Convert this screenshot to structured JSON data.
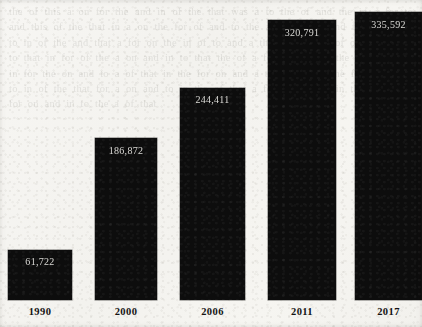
{
  "document": {
    "media": "scanned-page",
    "background_color": "#f6f5f2",
    "bleed_through_text": "the  of  this  a  on  for  the  and  in  of  the  that  was  a  to  the  of  and  the  in  a  for  to  and  this  of  the  that  in  a  on  the  for  of  and  to  the  a  in  that  of  and  the  on  for  a  to  in  of  the  and  that  a  for  on  the  in  of  to  and  a  the  that  for  in  of  on  the  a  and  to  that  in  for  of  the  a  on  and  in  to  that  the  of  a  for  on  in  and  the  to  that  of  a  in  for  the  on  and  to  a  of  that  in  the  for  on  and  a  to  of  in  that  the  for  on  a  and  to  in  of  the  that  for  a  on  and  to  in  the  of  that  a  for  on  and  to  in  the  a  of  that  for  on  and  in  to  the  a  of  that"
  },
  "chart_data": {
    "type": "bar",
    "title": "",
    "subtitle": "",
    "xlabel": "",
    "ylabel": "",
    "categories": [
      "1990",
      "2000",
      "2006",
      "2011",
      "2017"
    ],
    "values": [
      61722,
      186872,
      244411,
      320791,
      335592
    ],
    "value_labels": [
      "61,722",
      "186,872",
      "244,411",
      "320,791",
      "335,592"
    ],
    "series": [
      {
        "name": "",
        "values": [
          61722,
          186872,
          244411,
          320791,
          335592
        ]
      }
    ],
    "ylim": [
      0,
      355000
    ],
    "grid": false,
    "legend": false,
    "legend_position": "none",
    "axis_line": false,
    "bar_color": "#0d0d0d",
    "value_label_color": "#e9e8e4",
    "tick_label_color": "#141414",
    "value_label_position": "inside-top"
  },
  "bars": [
    {
      "category": "1990",
      "value_label": "61,722",
      "left": 8,
      "width": 64,
      "top": 250,
      "height": 50,
      "label_top": 256
    },
    {
      "category": "2000",
      "value_label": "186,872",
      "left": 95,
      "width": 62,
      "top": 138,
      "height": 162,
      "label_top": 145
    },
    {
      "category": "2006",
      "value_label": "244,411",
      "left": 180,
      "width": 65,
      "top": 88,
      "height": 212,
      "label_top": 94
    },
    {
      "category": "2011",
      "value_label": "320,791",
      "left": 268,
      "width": 68,
      "top": 20,
      "height": 280,
      "label_top": 27
    },
    {
      "category": "2017",
      "value_label": "335,592",
      "left": 355,
      "width": 67,
      "top": 12,
      "height": 288,
      "label_top": 19
    }
  ],
  "axis": {
    "baseline_y": 300,
    "tick_label_top": 306,
    "tick_labels": [
      {
        "text": "1990",
        "left": 8,
        "width": 64
      },
      {
        "text": "2000",
        "left": 95,
        "width": 62
      },
      {
        "text": "2006",
        "left": 180,
        "width": 65
      },
      {
        "text": "2011",
        "left": 268,
        "width": 68
      },
      {
        "text": "2017",
        "left": 355,
        "width": 67
      }
    ]
  }
}
